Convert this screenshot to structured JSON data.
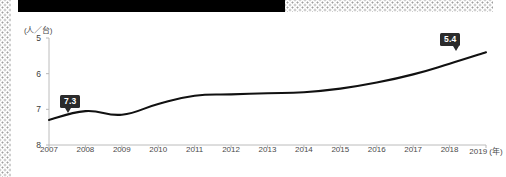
{
  "decorations": {
    "black_bar_name": "black-header-bar",
    "dot_pattern_name": "halftone-dot-pattern"
  },
  "chart_data": {
    "type": "line",
    "title": "",
    "subtitle": "",
    "xlabel": "(年)",
    "ylabel": "(人／台)",
    "unit_label": "(人／台)",
    "x_unit_label": "(年)",
    "categories": [
      "2007",
      "2008",
      "2009",
      "2010",
      "2011",
      "2012",
      "2013",
      "2014",
      "2015",
      "2016",
      "2017",
      "2018",
      "2019"
    ],
    "values": [
      7.3,
      7.05,
      7.15,
      6.85,
      6.62,
      6.58,
      6.55,
      6.52,
      6.42,
      6.25,
      6.02,
      5.72,
      5.4
    ],
    "series": [
      {
        "name": "人口あたり自動車保有台数",
        "values": [
          7.3,
          7.05,
          7.15,
          6.85,
          6.62,
          6.58,
          6.55,
          6.52,
          6.42,
          6.25,
          6.02,
          5.72,
          5.4
        ]
      }
    ],
    "ytick_labels": [
      "5",
      "6",
      "7",
      "8"
    ],
    "ytick_values": [
      5,
      6,
      7,
      8
    ],
    "ylim": [
      8,
      5
    ],
    "y_axis_inverted": true,
    "xlim": [
      2007,
      2019
    ],
    "grid": false,
    "legend": null,
    "legend_position": "none",
    "line_color": "#111111",
    "annotations": [
      {
        "name": "start-value",
        "label": "7.3",
        "x": "2007",
        "y": 7.3
      },
      {
        "name": "end-value",
        "label": "5.4",
        "x": "2019",
        "y": 5.4
      }
    ]
  },
  "callouts": {
    "start": "7.3",
    "end": "5.4"
  },
  "colors": {
    "line": "#111111",
    "axis": "#b8b8b8",
    "callout_bg": "#2b2b2b",
    "callout_text": "#ffffff",
    "tick_text": "#4a4a4a",
    "bar": "#000000"
  }
}
